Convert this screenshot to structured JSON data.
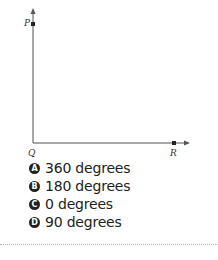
{
  "diagram": {
    "type": "right-angle",
    "points": [
      {
        "name": "P",
        "x": 33,
        "y": 24
      },
      {
        "name": "Q",
        "x": 33,
        "y": 143
      },
      {
        "name": "R",
        "x": 174,
        "y": 143
      }
    ],
    "labels": {
      "P": "P",
      "Q": "Q",
      "R": "R"
    },
    "line_color": "#888888",
    "point_color": "#222222"
  },
  "options": [
    {
      "letter": "A",
      "text": "360 degrees"
    },
    {
      "letter": "B",
      "text": "180 degrees"
    },
    {
      "letter": "C",
      "text": "0 degrees"
    },
    {
      "letter": "D",
      "text": "90 degrees"
    }
  ]
}
